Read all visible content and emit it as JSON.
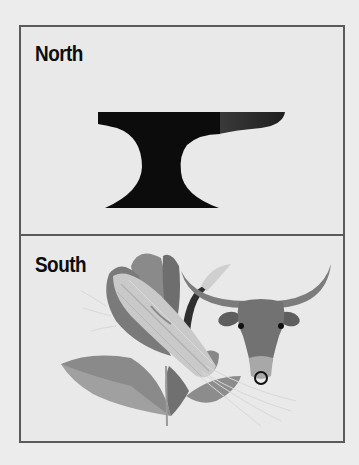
{
  "panels": [
    {
      "label": "North",
      "icon": "anvil-icon"
    },
    {
      "label": "South",
      "icon": "wheat-and-bull-icon"
    }
  ],
  "colors": {
    "background": "#ececec",
    "frame_border": "#5a5a5a",
    "panel_fill": "#e9e9e9",
    "label_text": "#0d0d0d",
    "anvil": "#0c0c0c",
    "anvil_horn": "#2e2e2e",
    "bull": "#6f6f6f",
    "leaves": "#7a7a7a",
    "wheat": "#c9c9c9"
  }
}
